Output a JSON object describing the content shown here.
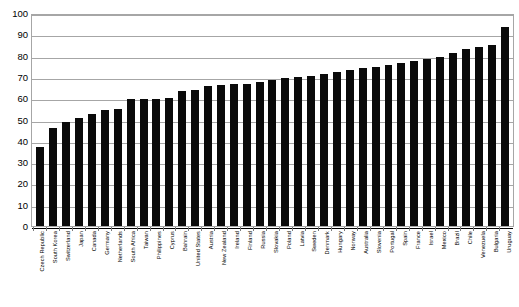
{
  "chart_data": {
    "type": "bar",
    "title": "",
    "subtitle": "",
    "xlabel": "",
    "ylabel": "",
    "ylim": [
      0,
      100
    ],
    "ytick_step": 10,
    "ytick_labels": [
      "100",
      "90",
      "80",
      "70",
      "60",
      "50",
      "40",
      "30",
      "20",
      "10",
      "0"
    ],
    "ytick_values": [
      100,
      90,
      80,
      70,
      60,
      50,
      40,
      30,
      20,
      10,
      0
    ],
    "grid": true,
    "legend": false,
    "legend_position": "none",
    "bar_color": "#0a0a0a",
    "grid_color": "#a6a6a6",
    "categories": [
      "Czech Republic",
      "South Korea",
      "Switzerland",
      "Japan",
      "Canada",
      "Germany",
      "Netherlands",
      "South Africa",
      "Taiwan",
      "Philippines",
      "Cyprus",
      "Bahrain",
      "United States",
      "Austria",
      "New Zealand",
      "Ireland",
      "Finland",
      "Russia",
      "Slovakia",
      "Poland",
      "Latvia",
      "Sweden",
      "Denmark",
      "Hungary",
      "Norway",
      "Australia",
      "Slovenia",
      "Portugal",
      "Spain",
      "France",
      "Israel",
      "Mexico",
      "Brazil",
      "Chile",
      "Venezuela",
      "Bulgaria",
      "Uruguay"
    ],
    "values": [
      37.0,
      46.2,
      48.6,
      50.8,
      52.4,
      54.3,
      54.8,
      59.6,
      59.5,
      59.7,
      60.2,
      63.4,
      63.7,
      65.7,
      66.0,
      66.8,
      66.7,
      67.4,
      68.4,
      69.5,
      70.0,
      70.6,
      71.5,
      72.2,
      73.2,
      74.0,
      74.8,
      75.5,
      76.6,
      77.3,
      78.6,
      79.2,
      81.3,
      83.0,
      84.2,
      84.8,
      93.5
    ]
  }
}
